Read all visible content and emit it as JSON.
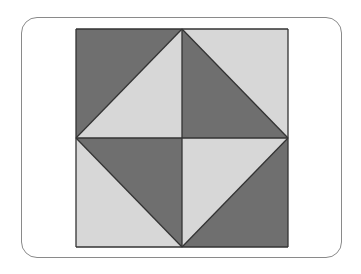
{
  "diagram": {
    "title": "",
    "type": "quilt-block-pattern",
    "square": {
      "x": 76,
      "y": 29,
      "size_w": 212,
      "size_h": 218
    },
    "colors": {
      "dark": "#6f6f6f",
      "light": "#d7d7d7",
      "stroke": "#333333",
      "frame": "#8a8a8a"
    },
    "quadrants": [
      {
        "position": "top-left",
        "triangles": [
          {
            "part": "upper-left",
            "color": "dark"
          },
          {
            "part": "lower-right",
            "color": "light"
          }
        ]
      },
      {
        "position": "top-right",
        "triangles": [
          {
            "part": "upper-right",
            "color": "light"
          },
          {
            "part": "lower-left",
            "color": "dark"
          }
        ]
      },
      {
        "position": "bottom-left",
        "triangles": [
          {
            "part": "upper-right",
            "color": "dark"
          },
          {
            "part": "lower-left",
            "color": "light"
          }
        ]
      },
      {
        "position": "bottom-right",
        "triangles": [
          {
            "part": "upper-left",
            "color": "light"
          },
          {
            "part": "lower-right",
            "color": "dark"
          }
        ]
      }
    ]
  }
}
